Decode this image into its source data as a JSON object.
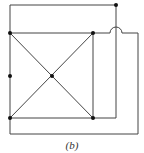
{
  "caption": "(b)",
  "colors": {
    "edge": "#444444",
    "node": "#111111",
    "background": "#ffffff"
  },
  "nodes": [
    {
      "id": "top-right-outer",
      "x": 116,
      "y": 5
    },
    {
      "id": "square-top-left",
      "x": 10,
      "y": 33
    },
    {
      "id": "square-top-right",
      "x": 93,
      "y": 33
    },
    {
      "id": "left-middle",
      "x": 10,
      "y": 76
    },
    {
      "id": "center",
      "x": 52,
      "y": 76
    },
    {
      "id": "square-bottom-left",
      "x": 10,
      "y": 118
    },
    {
      "id": "square-bottom-right",
      "x": 93,
      "y": 118
    }
  ],
  "edges": [
    {
      "id": "top-outer",
      "path": "M10 5 L116 5"
    },
    {
      "id": "left-vertical",
      "path": "M10 5 L10 134"
    },
    {
      "id": "square-top",
      "path": "M10 33 L93 33"
    },
    {
      "id": "square-right",
      "path": "M93 33 L93 118"
    },
    {
      "id": "square-bottom",
      "path": "M10 118 L93 118"
    },
    {
      "id": "diagonal-1",
      "path": "M10 33 L93 118"
    },
    {
      "id": "diagonal-2",
      "path": "M93 33 L10 118"
    },
    {
      "id": "right-loop",
      "path": "M116 5 L116 118 L93 118"
    },
    {
      "id": "outer-loop-with-hop",
      "path": "M93 33 L110 33 A6 6 0 0 1 122 33 L138 33 L138 134 L10 134"
    }
  ]
}
